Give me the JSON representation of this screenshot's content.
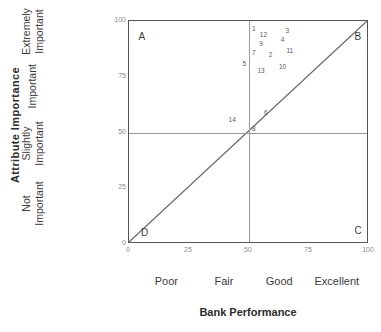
{
  "chart_data": {
    "type": "scatter",
    "title": "",
    "xlabel": "Bank Performance",
    "ylabel": "Attribute Importance",
    "xlim": [
      0,
      100
    ],
    "ylim": [
      0,
      100
    ],
    "grid": true,
    "legend_position": "none",
    "x_ticks": [
      0,
      25,
      50,
      75,
      100
    ],
    "y_ticks": [
      0,
      25,
      50,
      75,
      100
    ],
    "x_tick_labels": [
      "0",
      "25",
      "50",
      "75",
      "100"
    ],
    "y_tick_labels": [
      "0",
      "25",
      "50",
      "75",
      "100"
    ],
    "x_category_labels": [
      {
        "label": "Poor",
        "at": 16
      },
      {
        "label": "Fair",
        "at": 40
      },
      {
        "label": "Good",
        "at": 63
      },
      {
        "label": "Excellent",
        "at": 87
      }
    ],
    "y_category_labels": [
      {
        "line1": "Extremely",
        "line2": "Important",
        "at": 88
      },
      {
        "line1": "Important",
        "line2": "",
        "at": 64
      },
      {
        "line1": "Slightly",
        "line2": "Important",
        "at": 38
      },
      {
        "line1": "Not",
        "line2": "Important",
        "at": 12
      }
    ],
    "reference_lines": {
      "horizontal": [
        50
      ],
      "vertical": [
        50
      ],
      "diagonal": {
        "from": [
          0,
          0
        ],
        "to": [
          100,
          100
        ]
      }
    },
    "quadrants": [
      {
        "label": "A",
        "x": 4,
        "y": 93
      },
      {
        "label": "B",
        "x": 94,
        "y": 93
      },
      {
        "label": "C",
        "x": 94,
        "y": 6
      },
      {
        "label": "D",
        "x": 5,
        "y": 5
      }
    ],
    "points": [
      {
        "label": "1",
        "x": 52,
        "y": 97
      },
      {
        "label": "12",
        "x": 56,
        "y": 94
      },
      {
        "label": "3",
        "x": 66,
        "y": 96
      },
      {
        "label": "9",
        "x": 55,
        "y": 90
      },
      {
        "label": "4",
        "x": 64,
        "y": 92
      },
      {
        "label": "7",
        "x": 52,
        "y": 86
      },
      {
        "label": "2",
        "x": 59,
        "y": 85
      },
      {
        "label": "11",
        "x": 67,
        "y": 87
      },
      {
        "label": "5",
        "x": 48,
        "y": 81
      },
      {
        "label": "13",
        "x": 55,
        "y": 78
      },
      {
        "label": "10",
        "x": 64,
        "y": 80
      },
      {
        "label": "14",
        "x": 43,
        "y": 56
      },
      {
        "label": "6",
        "x": 57,
        "y": 59
      },
      {
        "label": "8",
        "x": 52,
        "y": 52
      }
    ],
    "colors": {
      "frame": "#555555",
      "gridline": "#9a9a9a",
      "diagonal": "#666666",
      "point_label": "#5a5a5a",
      "tick_label": "#8a8a8a",
      "axis_title": "#2b2b2b"
    }
  }
}
